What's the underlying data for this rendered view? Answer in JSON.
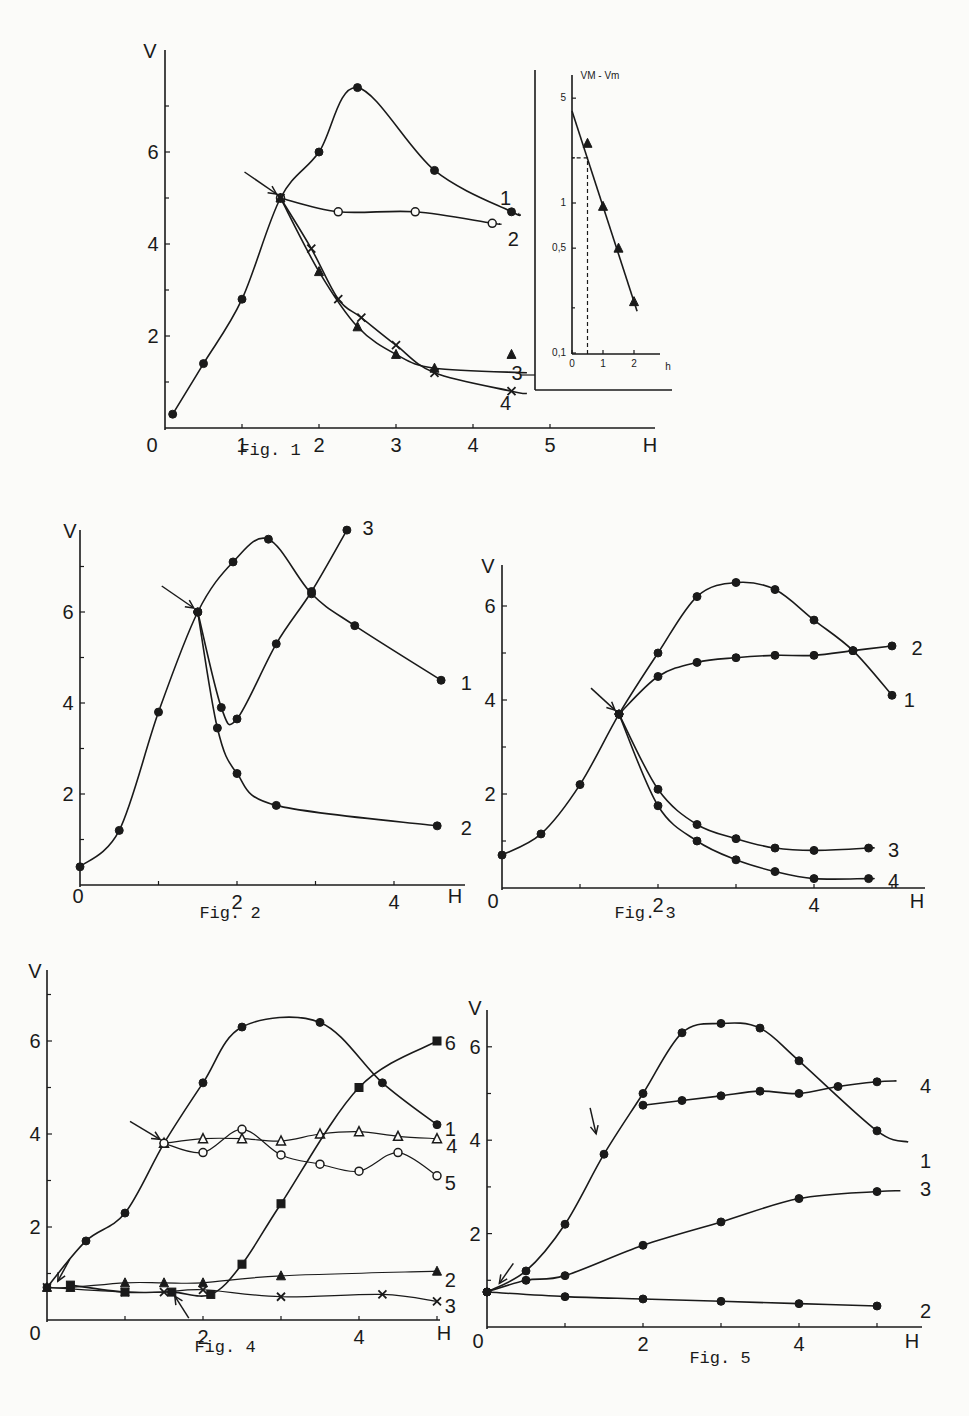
{
  "figures": [
    {
      "id": "fig1",
      "caption": "Fig. 1",
      "xlabel": "H",
      "ylabel": "V",
      "origin_label": "0",
      "xticks": [
        "1",
        "2",
        "3",
        "4",
        "5"
      ],
      "yticks": [
        "2",
        "4",
        "6"
      ]
    },
    {
      "id": "fig1-inset",
      "xlabel": "h",
      "ylabel": "V_M - V_m",
      "xticks": [
        "0",
        "1",
        "2"
      ],
      "yticks": [
        "5",
        "1",
        "0,5",
        "0,1"
      ]
    },
    {
      "id": "fig2",
      "caption": "Fig. 2",
      "xlabel": "H",
      "ylabel": "V",
      "origin_label": "0",
      "xticks": [
        "2",
        "4"
      ],
      "yticks": [
        "2",
        "4",
        "6"
      ]
    },
    {
      "id": "fig3",
      "caption": "Fig. 3",
      "xlabel": "H",
      "ylabel": "V",
      "origin_label": "0",
      "xticks": [
        "2",
        "4"
      ],
      "yticks": [
        "2",
        "4",
        "6"
      ]
    },
    {
      "id": "fig4",
      "caption": "Fig. 4",
      "xlabel": "H",
      "ylabel": "V",
      "origin_label": "0",
      "xticks": [
        "2",
        "4"
      ],
      "yticks": [
        "2",
        "4",
        "6"
      ]
    },
    {
      "id": "fig5",
      "caption": "Fig. 5",
      "xlabel": "H",
      "ylabel": "V",
      "origin_label": "0",
      "xticks": [
        "2",
        "4"
      ],
      "yticks": [
        "2",
        "4",
        "6"
      ]
    }
  ],
  "chart_data": [
    {
      "type": "line",
      "title": "Fig. 1",
      "xlabel": "H",
      "ylabel": "V",
      "xlim": [
        0,
        6.5
      ],
      "ylim": [
        0,
        7.8
      ],
      "annotation": "arrow at H=1.5, V=5.0",
      "series": [
        {
          "name": "1",
          "marker": "filled-circle",
          "x": [
            0.1,
            0.5,
            1.0,
            1.5,
            2.0,
            2.5,
            3.5,
            4.5
          ],
          "y": [
            0.3,
            1.4,
            2.8,
            5.0,
            6.0,
            7.4,
            5.6,
            4.7
          ]
        },
        {
          "name": "2",
          "marker": "open-circle",
          "x": [
            1.5,
            2.25,
            3.25,
            4.25
          ],
          "y": [
            5.0,
            4.7,
            4.7,
            4.45
          ]
        },
        {
          "name": "3",
          "marker": "filled-triangle",
          "x": [
            1.5,
            2.0,
            2.5,
            3.0,
            3.5,
            4.5
          ],
          "y": [
            5.0,
            3.4,
            2.2,
            1.6,
            1.3,
            1.6
          ]
        },
        {
          "name": "4",
          "marker": "cross",
          "x": [
            1.5,
            1.9,
            2.25,
            2.55,
            3.0,
            3.5,
            4.5
          ],
          "y": [
            5.0,
            3.9,
            2.8,
            2.4,
            1.8,
            1.2,
            0.8
          ]
        }
      ]
    },
    {
      "type": "line",
      "title": "Fig. 1 inset",
      "xlabel": "h",
      "ylabel": "V_M - V_m",
      "yscale": "log",
      "xlim": [
        0,
        2.7
      ],
      "ylim": [
        0.1,
        6
      ],
      "annotation": "dashed guide at h=0.5, V_M-V_m=2",
      "series": [
        {
          "name": "fit",
          "marker": "filled-triangle",
          "x": [
            0.5,
            1.0,
            1.5,
            2.0
          ],
          "y": [
            2.5,
            0.95,
            0.5,
            0.22
          ]
        }
      ]
    },
    {
      "type": "line",
      "title": "Fig. 2",
      "xlabel": "H",
      "ylabel": "V",
      "xlim": [
        0,
        5.0
      ],
      "ylim": [
        0,
        8.2
      ],
      "annotation": "arrow at H=1.5, V=6.0",
      "series": [
        {
          "name": "1",
          "marker": "filled-circle",
          "x": [
            0,
            0.5,
            1.0,
            1.5,
            1.95,
            2.4,
            2.95,
            3.5,
            4.6
          ],
          "y": [
            0.4,
            1.2,
            3.8,
            6.0,
            7.1,
            7.6,
            6.4,
            5.7,
            4.5
          ]
        },
        {
          "name": "2",
          "marker": "filled-circle",
          "x": [
            1.5,
            1.75,
            2.0,
            2.5,
            4.55
          ],
          "y": [
            6.0,
            3.45,
            2.45,
            1.75,
            1.3
          ]
        },
        {
          "name": "3",
          "marker": "filled-circle",
          "x": [
            1.5,
            1.8,
            2.0,
            2.5,
            2.95,
            3.4
          ],
          "y": [
            6.0,
            3.9,
            3.65,
            5.3,
            6.45,
            7.8
          ]
        }
      ]
    },
    {
      "type": "line",
      "title": "Fig. 3",
      "xlabel": "H",
      "ylabel": "V",
      "xlim": [
        0,
        5.3
      ],
      "ylim": [
        0,
        6.8
      ],
      "annotation": "arrow at H=1.5, V=3.7",
      "series": [
        {
          "name": "1",
          "marker": "filled-circle",
          "x": [
            0,
            0.5,
            1.0,
            1.5,
            2.0,
            2.5,
            3.0,
            3.5,
            4.0,
            4.5,
            5.0
          ],
          "y": [
            0.7,
            1.15,
            2.2,
            3.7,
            5.0,
            6.2,
            6.5,
            6.35,
            5.7,
            5.05,
            4.1
          ]
        },
        {
          "name": "2",
          "marker": "filled-circle",
          "x": [
            1.5,
            2.0,
            2.5,
            3.0,
            3.5,
            4.0,
            4.5,
            5.0
          ],
          "y": [
            3.7,
            4.5,
            4.8,
            4.9,
            4.95,
            4.95,
            5.05,
            5.15
          ]
        },
        {
          "name": "3",
          "marker": "filled-circle",
          "x": [
            1.5,
            2.0,
            2.5,
            3.0,
            3.5,
            4.0,
            4.7
          ],
          "y": [
            3.7,
            2.1,
            1.35,
            1.05,
            0.85,
            0.8,
            0.85
          ]
        },
        {
          "name": "4",
          "marker": "filled-circle",
          "x": [
            1.5,
            2.0,
            2.5,
            3.0,
            3.5,
            4.0,
            4.7
          ],
          "y": [
            3.7,
            1.75,
            1.0,
            0.6,
            0.35,
            0.2,
            0.2
          ]
        }
      ]
    },
    {
      "type": "line",
      "title": "Fig. 4",
      "xlabel": "H",
      "ylabel": "V",
      "xlim": [
        0,
        5.2
      ],
      "ylim": [
        0,
        7.0
      ],
      "annotation": "arrows at H=0.1 V=0.7, H=1.5 V=3.8 and H=1.6 V=0.6",
      "series": [
        {
          "name": "1",
          "marker": "filled-circle",
          "x": [
            0,
            0.5,
            1.0,
            1.5,
            2.0,
            2.5,
            3.5,
            4.3,
            5.0
          ],
          "y": [
            0.7,
            1.7,
            2.3,
            3.8,
            5.1,
            6.3,
            6.4,
            5.1,
            4.2
          ]
        },
        {
          "name": "2",
          "marker": "filled-triangle",
          "x": [
            0,
            0.3,
            1.0,
            1.5,
            2.0,
            3.0,
            5.0
          ],
          "y": [
            0.7,
            0.7,
            0.8,
            0.8,
            0.8,
            0.95,
            1.05
          ]
        },
        {
          "name": "3",
          "marker": "cross",
          "x": [
            0,
            1.0,
            1.5,
            2.0,
            3.0,
            4.3,
            5.0
          ],
          "y": [
            0.7,
            0.6,
            0.6,
            0.65,
            0.5,
            0.55,
            0.4
          ]
        },
        {
          "name": "4",
          "marker": "open-triangle",
          "x": [
            1.5,
            2.0,
            2.5,
            3.0,
            3.5,
            4.0,
            4.5,
            5.0
          ],
          "y": [
            3.8,
            3.9,
            3.9,
            3.85,
            4.0,
            4.05,
            3.95,
            3.9
          ]
        },
        {
          "name": "5",
          "marker": "open-circle",
          "x": [
            1.5,
            2.0,
            2.5,
            3.0,
            3.5,
            4.0,
            4.5,
            5.0
          ],
          "y": [
            3.8,
            3.6,
            4.1,
            3.55,
            3.35,
            3.2,
            3.6,
            3.1
          ]
        },
        {
          "name": "6",
          "marker": "filled-square",
          "x": [
            0.3,
            1.0,
            1.6,
            2.1,
            2.5,
            3.0,
            4.0,
            5.0
          ],
          "y": [
            0.75,
            0.6,
            0.6,
            0.55,
            1.2,
            2.5,
            5.0,
            6.0
          ]
        }
      ]
    },
    {
      "type": "line",
      "title": "Fig. 5",
      "xlabel": "H",
      "ylabel": "V",
      "xlim": [
        0,
        5.5
      ],
      "ylim": [
        0,
        6.8
      ],
      "annotation": "arrows at H=0.1 V=0.75 and H=1.5 V=3.7",
      "series": [
        {
          "name": "1",
          "marker": "filled-circle",
          "x": [
            0,
            0.5,
            1.0,
            1.5,
            2.0,
            2.5,
            3.0,
            3.5,
            4.0,
            5.0
          ],
          "y": [
            0.75,
            1.2,
            2.2,
            3.7,
            5.0,
            6.3,
            6.5,
            6.4,
            5.7,
            4.2
          ]
        },
        {
          "name": "2",
          "marker": "filled-circle",
          "x": [
            0,
            1.0,
            2.0,
            3.0,
            4.0,
            5.0
          ],
          "y": [
            0.75,
            0.65,
            0.6,
            0.55,
            0.5,
            0.45
          ]
        },
        {
          "name": "3",
          "marker": "filled-circle",
          "x": [
            0,
            0.5,
            1.0,
            2.0,
            3.0,
            4.0,
            5.0
          ],
          "y": [
            0.75,
            1.0,
            1.1,
            1.75,
            2.25,
            2.75,
            2.9
          ]
        },
        {
          "name": "4",
          "marker": "filled-circle",
          "x": [
            2.0,
            2.5,
            3.0,
            3.5,
            4.0,
            4.5,
            5.0
          ],
          "y": [
            4.75,
            4.85,
            4.95,
            5.05,
            5.0,
            5.15,
            5.25
          ]
        }
      ]
    }
  ]
}
